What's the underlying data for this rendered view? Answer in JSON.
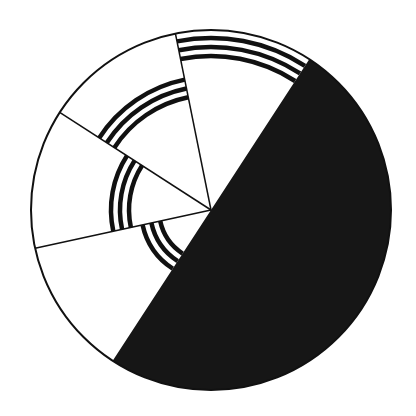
{
  "diagram": {
    "type": "pie-sector-diagram",
    "center": [
      211,
      210
    ],
    "radius": 180,
    "outline_color": "#111111",
    "outline_width": 2,
    "divider_width": 1.5,
    "background": "#ffffff",
    "filled_half": {
      "label": "filled-half",
      "start_angle": -56.9,
      "end_angle": 123.1,
      "color": "#161616"
    },
    "sectors": [
      {
        "id": "sector-1",
        "start_angle": -101.4,
        "end_angle": -56.9,
        "fill": "#ffffff",
        "arc_band": {
          "radii": [
            172,
            163,
            154
          ],
          "stroke": 4.5,
          "color": "#111111"
        }
      },
      {
        "id": "sector-2",
        "start_angle": -147.2,
        "end_angle": -101.4,
        "fill": "#ffffff",
        "arc_band": {
          "radii": [
            133,
            124,
            115
          ],
          "stroke": 4.5,
          "color": "#111111"
        }
      },
      {
        "id": "sector-3",
        "start_angle": -192.3,
        "end_angle": -147.2,
        "fill": "#ffffff",
        "arc_band": {
          "radii": [
            100,
            91,
            82
          ],
          "stroke": 4.5,
          "color": "#111111"
        }
      },
      {
        "id": "sector-4",
        "start_angle": 123.1,
        "end_angle": 167.7,
        "fill": "#ffffff",
        "arc_band": {
          "radii": [
            70,
            61,
            52
          ],
          "stroke": 4.5,
          "color": "#111111"
        }
      }
    ],
    "dividers": [
      -101.4,
      -147.2,
      167.7
    ]
  }
}
